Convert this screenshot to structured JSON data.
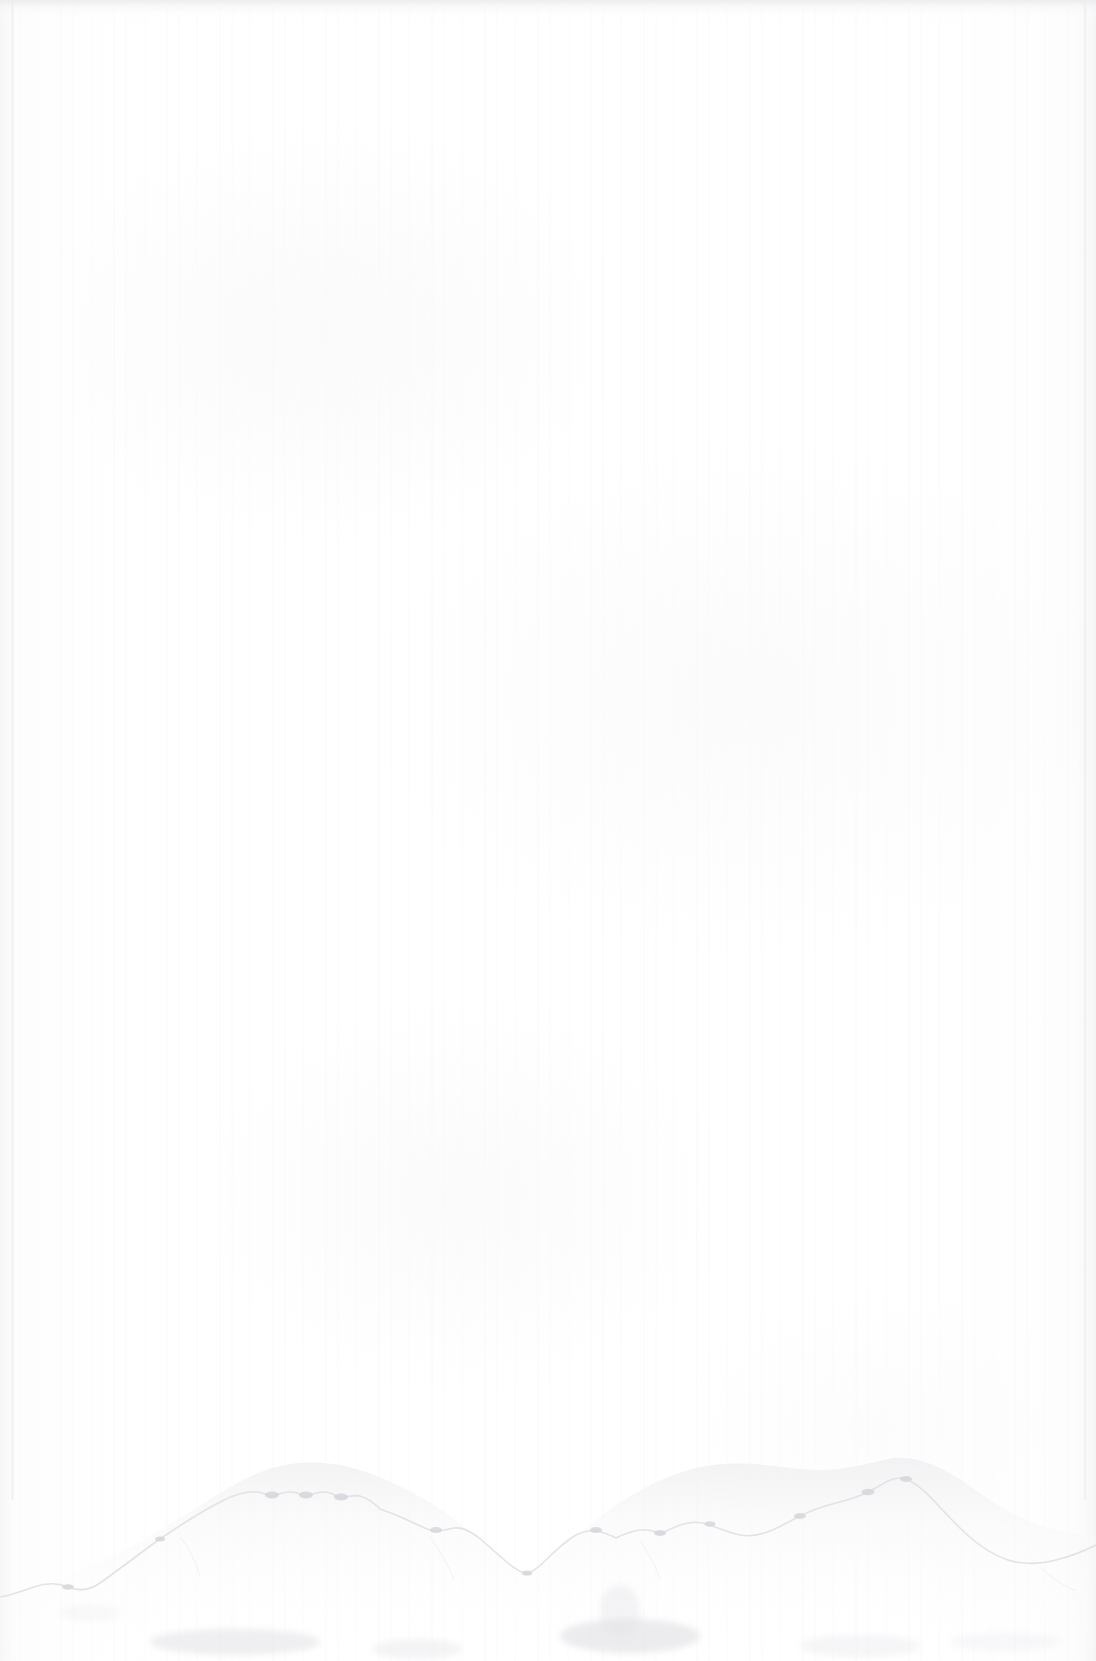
{
  "document": {
    "kind": "scanned-page-image",
    "page_state": "blank",
    "transcribed_text": "",
    "visible_text_count": "0",
    "orientation": "portrait",
    "width_px": "1096",
    "height_px": "1661"
  },
  "paper": {
    "description": "blank scanned sheet, no printed or handwritten content visible",
    "base_color": "#ffffff",
    "shade_color": "#fdfdfd",
    "streak_color": "#f4f4f6",
    "edge_line_color": "#ececef",
    "top_band_color": "#ececee"
  },
  "features": {
    "torn_edge": {
      "name": "deckled bottom edge",
      "color": "#e9e9ec",
      "shadow_color": "#f2f2f4",
      "left_y": "1596",
      "first_peak_x": "300",
      "first_peak_y": "1462",
      "valley_x": "527",
      "valley_y": "1572",
      "second_peak_x": "888",
      "second_peak_y": "1458",
      "right_y": "1536"
    },
    "smudges": {
      "name": "faint grime along lower edge",
      "color": "#e2e2e6",
      "count": "7"
    },
    "left_edge_line": {
      "name": "sheet left boundary",
      "x": "12"
    },
    "right_edge_line": {
      "name": "sheet right boundary",
      "x": "1085"
    },
    "top_edge_band": {
      "name": "sheet top boundary shading",
      "height": "22"
    }
  }
}
